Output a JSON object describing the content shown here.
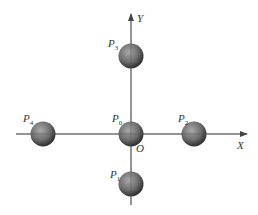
{
  "diagram": {
    "axes": {
      "x_label": "X",
      "y_label": "Y",
      "origin_label": "O"
    },
    "points": [
      {
        "name": "P",
        "sub": "0",
        "cx": 131,
        "cy": 134,
        "lx": 112,
        "ly": 127
      },
      {
        "name": "P",
        "sub": "1",
        "cx": 131,
        "cy": 184,
        "lx": 110,
        "ly": 178
      },
      {
        "name": "P",
        "sub": "2",
        "cx": 194,
        "cy": 134,
        "lx": 178,
        "ly": 123
      },
      {
        "name": "P",
        "sub": "3",
        "cx": 131,
        "cy": 56,
        "lx": 110,
        "ly": 47
      },
      {
        "name": "P",
        "sub": "4",
        "cx": 43,
        "cy": 134,
        "lx": 23,
        "ly": 123
      }
    ],
    "colors": {
      "axis": "#555555",
      "sphere_light": "#9a9a9a",
      "sphere_dark": "#3a3a3a"
    }
  }
}
